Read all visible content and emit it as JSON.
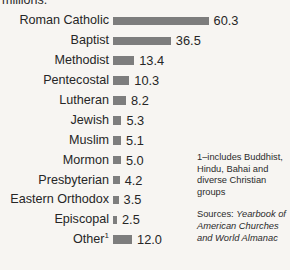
{
  "caption": {
    "clipped_line": "millions."
  },
  "chart_data": {
    "type": "bar",
    "orientation": "horizontal",
    "title": "",
    "xlabel": "",
    "ylabel": "",
    "units_note": "millions.",
    "grid": false,
    "legend": "none",
    "axis_max": 63,
    "categories": [
      "Roman Catholic",
      "Baptist",
      "Methodist",
      "Pentecostal",
      "Lutheran",
      "Jewish",
      "Muslim",
      "Mormon",
      "Presbyterian",
      "Eastern Orthodox",
      "Episcopal",
      "Other"
    ],
    "values": [
      60.3,
      36.5,
      13.4,
      10.3,
      8.2,
      5.3,
      5.1,
      5.0,
      4.2,
      3.5,
      2.5,
      12.0
    ],
    "value_labels": [
      "60.3",
      "36.5",
      "13.4",
      "10.3",
      "8.2",
      "5.3",
      "5.1",
      "5.0",
      "4.2",
      "3.5",
      "2.5",
      "12.0"
    ],
    "footnote_markers": [
      "",
      "",
      "",
      "",
      "",
      "",
      "",
      "",
      "",
      "",
      "",
      "1"
    ],
    "bar_color": "#7d7d7d",
    "background_color": "#f7f5f2",
    "text_color": "#262626"
  },
  "notes": {
    "footnote": "1–includes Buddhist, Hindu, Bahai and diverse Christian groups",
    "sources_label": "Sources: ",
    "sources_text": "Yearbook of American Churches and World Almanac"
  }
}
